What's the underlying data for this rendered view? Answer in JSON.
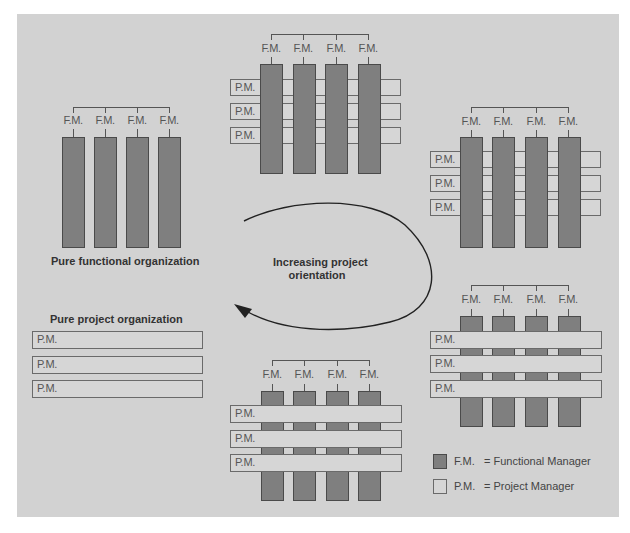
{
  "diagram": {
    "type": "organizational-structure-continuum",
    "center_label_line1": "Increasing project",
    "center_label_line2": "orientation",
    "fm_label": "F.M.",
    "pm_label": "P.M.",
    "colors": {
      "panel_bg": "#d2d2d2",
      "functional_manager": "#7f7f7f",
      "project_manager": "#d6d6d6",
      "outline": "#4a4a4a",
      "arrow": "#222222"
    }
  },
  "structures": [
    {
      "name": "Pure functional organization",
      "functional_managers": 4,
      "project_managers": 0
    },
    {
      "name": "Weak matrix (functional dominant)",
      "functional_managers": 4,
      "project_managers": 3,
      "pm_layer": "behind"
    },
    {
      "name": "Balanced matrix (functional over project)",
      "functional_managers": 4,
      "project_managers": 3,
      "pm_layer": "behind"
    },
    {
      "name": "Strong matrix (project dominant)",
      "functional_managers": 4,
      "project_managers": 3,
      "pm_layer": "front"
    },
    {
      "name": "Project-dominant matrix",
      "functional_managers": 4,
      "project_managers": 3,
      "pm_layer": "front"
    },
    {
      "name": "Pure project organization",
      "functional_managers": 0,
      "project_managers": 3
    }
  ],
  "titles": {
    "pure_functional": "Pure functional organization",
    "pure_project": "Pure project organization"
  },
  "legend": {
    "items": [
      {
        "abbr": "F.M.",
        "meaning": "= Functional Manager",
        "color": "#7f7f7f"
      },
      {
        "abbr": "P.M.",
        "meaning": "= Project Manager",
        "color": "#d6d6d6"
      }
    ]
  }
}
